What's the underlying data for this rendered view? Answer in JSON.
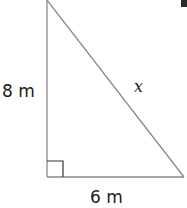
{
  "diagram": {
    "type": "right-triangle",
    "labels": {
      "vertical_leg": "8 m",
      "horizontal_leg": "6 m",
      "hypotenuse": "x"
    },
    "right_angle_marker": true,
    "colors": {
      "stroke": "#8a8a8a",
      "marker_stroke": "#333333",
      "text": "#1a1a1a"
    }
  }
}
